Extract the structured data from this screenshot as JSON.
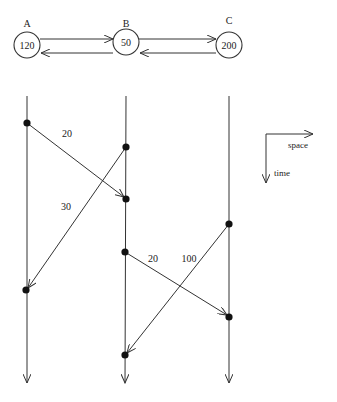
{
  "topology": {
    "nodes": [
      {
        "name": "A",
        "value": "120"
      },
      {
        "name": "B",
        "value": "50"
      },
      {
        "name": "C",
        "value": "200"
      }
    ]
  },
  "timeline": {
    "messages": [
      {
        "from": "A",
        "to": "B",
        "label": "20"
      },
      {
        "from": "B",
        "to": "A",
        "label": "30"
      },
      {
        "from": "B",
        "to": "C",
        "label": "20"
      },
      {
        "from": "C",
        "to": "B",
        "label": "100"
      }
    ]
  },
  "legend": {
    "space_label": "space",
    "time_label": "time"
  },
  "colors": {
    "stroke": "#333333",
    "background": "#ffffff"
  }
}
